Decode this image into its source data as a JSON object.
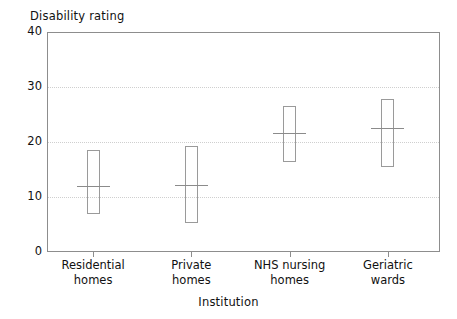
{
  "chart_data": {
    "type": "box",
    "title": "",
    "ylabel": "Disability rating",
    "xlabel": "Institution",
    "ylim": [
      0,
      40
    ],
    "yticks": [
      0,
      10,
      20,
      30,
      40
    ],
    "grid": true,
    "legend": "none",
    "categories": [
      "Residential\nhomes",
      "Private\nhomes",
      "NHS nursing\nhomes",
      "Geriatric\nwards"
    ],
    "category_lines": [
      [
        "Residential",
        "homes"
      ],
      [
        "Private",
        "homes"
      ],
      [
        "NHS nursing",
        "homes"
      ],
      [
        "Geriatric",
        "wards"
      ]
    ],
    "series": [
      {
        "name": "Disability rating range",
        "points": [
          {
            "category": "Residential homes",
            "upper": 18.5,
            "median": 12.0,
            "lower": 7.0
          },
          {
            "category": "Private homes",
            "upper": 19.2,
            "median": 12.2,
            "lower": 5.3
          },
          {
            "category": "NHS nursing homes",
            "upper": 26.5,
            "median": 21.7,
            "lower": 16.3
          },
          {
            "category": "Geriatric wards",
            "upper": 27.8,
            "median": 22.5,
            "lower": 15.5
          }
        ]
      }
    ],
    "colors": {
      "box_stroke": "#9a9a9a",
      "median_stroke": "#8b8b8b",
      "axis": "#8d8d8d",
      "grid": "#cfcfcf",
      "text": "#111111",
      "background": "#ffffff"
    }
  },
  "axes": {
    "y_title": "Disability rating",
    "x_title": "Institution",
    "y_tick_labels": [
      "40",
      "30",
      "20",
      "10",
      "0"
    ]
  }
}
